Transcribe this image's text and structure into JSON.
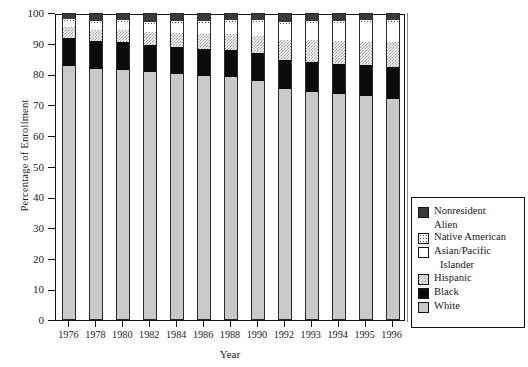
{
  "chart_data": {
    "type": "bar",
    "subtype": "stacked-percentage",
    "title": "",
    "xlabel": "Year",
    "ylabel": "Percentage of Enrollment",
    "ylim": [
      0,
      100
    ],
    "yticks": [
      0,
      10,
      20,
      30,
      40,
      50,
      60,
      70,
      80,
      90,
      100
    ],
    "grid": false,
    "legend_position": "right-outside",
    "categories": [
      "1976",
      "1978",
      "1980",
      "1982",
      "1984",
      "1986",
      "1988",
      "1990",
      "1992",
      "1993",
      "1994",
      "1995",
      "1996"
    ],
    "stack_order_bottom_to_top": [
      "White",
      "Black",
      "Hispanic",
      "Asian/Pacific Islander",
      "Native American",
      "Nonresident Alien"
    ],
    "series": [
      {
        "name": "White",
        "values": [
          82.6,
          81.9,
          81.4,
          80.7,
          80.2,
          79.5,
          79.2,
          77.9,
          75.2,
          74.4,
          73.6,
          72.9,
          72.0
        ]
      },
      {
        "name": "Black",
        "values": [
          9.4,
          9.1,
          9.2,
          8.8,
          8.8,
          8.7,
          8.7,
          9.0,
          9.5,
          9.7,
          9.9,
          10.1,
          10.4
        ]
      },
      {
        "name": "Hispanic",
        "values": [
          3.5,
          3.5,
          3.9,
          4.2,
          4.4,
          4.9,
          5.2,
          5.7,
          6.6,
          7.0,
          7.4,
          7.7,
          8.1
        ]
      },
      {
        "name": "Asian/Pacific Islander",
        "values": [
          1.8,
          2.1,
          2.4,
          2.7,
          3.2,
          3.6,
          4.0,
          4.3,
          5.1,
          5.4,
          5.7,
          6.0,
          6.3
        ]
      },
      {
        "name": "Native American",
        "values": [
          0.7,
          0.7,
          0.7,
          0.7,
          0.7,
          0.7,
          0.7,
          0.7,
          0.8,
          0.8,
          0.9,
          0.9,
          0.9
        ]
      },
      {
        "name": "Nonresident Alien",
        "values": [
          2.0,
          2.7,
          2.4,
          2.9,
          2.7,
          2.6,
          2.2,
          2.4,
          2.8,
          2.7,
          2.5,
          2.4,
          2.3
        ]
      }
    ]
  },
  "legend": {
    "items": [
      {
        "label": "Nonresident",
        "label2": "Alien",
        "swatch": "nonres",
        "indent2": false
      },
      {
        "label": "Native American",
        "label2": "",
        "swatch": "native",
        "indent2": false
      },
      {
        "label": "Asian/Pacific",
        "label2": "Islander",
        "swatch": "asian",
        "indent2": true
      },
      {
        "label": "Hispanic",
        "label2": "",
        "swatch": "hisp",
        "indent2": false
      },
      {
        "label": "Black",
        "label2": "",
        "swatch": "black",
        "indent2": false
      },
      {
        "label": "White",
        "label2": "",
        "swatch": "white",
        "indent2": false
      }
    ]
  },
  "colors": {
    "white_seg": "#c9c9c9",
    "black_seg": "#0b0b0b",
    "hispanic_seg": "#9a9a9a",
    "asian_seg": "#ffffff",
    "native_seg": "#4a4a4a",
    "nonresident_seg": "#3a3a3a",
    "axis": "#151515"
  }
}
